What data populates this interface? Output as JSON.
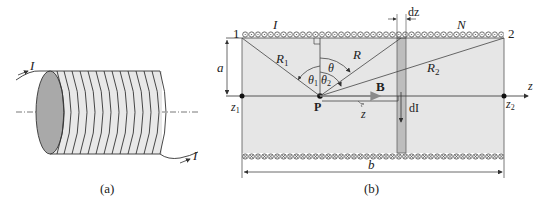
{
  "figure_a": {
    "caption": "(a)",
    "current_in_label": "I",
    "current_out_label": "I"
  },
  "figure_b": {
    "caption": "(b)",
    "current_label": "I",
    "turns_label": "N",
    "end1_label": "1",
    "end2_label": "2",
    "radius_label": "a",
    "length_label": "b",
    "dz_label": "dz",
    "dI_label": "dI",
    "R1_label": "R",
    "R1_sub": "1",
    "R2_label": "R",
    "R2_sub": "2",
    "R_label": "R",
    "theta_label": "θ",
    "theta1_label": "θ",
    "theta1_sub": "1",
    "theta2_label": "θ",
    "theta2_sub": "2",
    "point_label": "P",
    "field_label": "B",
    "z_offset_label": "z",
    "axis_label": "z",
    "z1_label": "z",
    "z1_sub": "1",
    "z2_label": "z",
    "z2_sub": "2"
  },
  "colors": {
    "interior_fill": "#e6e6e6",
    "end_fill": "#a9a9a9",
    "strip_fill": "#bdbdbd",
    "line": "#444444",
    "field_arrow": "#8a8a8a"
  }
}
